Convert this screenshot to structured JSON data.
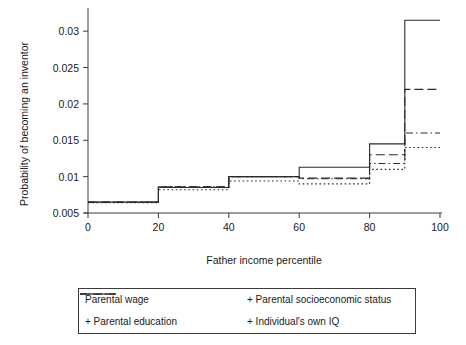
{
  "chart_data": {
    "type": "line",
    "title": "",
    "xlabel": "Father income percentile",
    "ylabel": "Probability of becoming an inventor",
    "xlim": [
      0,
      100
    ],
    "ylim": [
      0.005,
      0.0325
    ],
    "xticks": [
      0,
      20,
      40,
      60,
      80,
      100
    ],
    "xtick_labels": [
      "0",
      "20",
      "40",
      "60",
      "80",
      "100"
    ],
    "yticks": [
      0.005,
      0.01,
      0.015,
      0.02,
      0.025,
      0.03
    ],
    "ytick_labels": [
      "0.005",
      "0.01",
      "0.015",
      "0.02",
      "0.025",
      "0.03"
    ],
    "grid": false,
    "legend_position": "below",
    "step_edges": [
      0,
      20,
      40,
      60,
      80,
      90,
      100
    ],
    "series": [
      {
        "name": "Parental wage",
        "style": "solid",
        "values": [
          0.0065,
          0.0085,
          0.01,
          0.0113,
          0.0145,
          0.0315
        ]
      },
      {
        "name": "+ Parental socioeconomic status",
        "style": "long-dash",
        "values": [
          0.0065,
          0.0086,
          0.01,
          0.0098,
          0.013,
          0.022
        ]
      },
      {
        "name": "+ Parental education",
        "style": "dash-dot",
        "values": [
          0.0065,
          0.0086,
          0.01,
          0.0097,
          0.0118,
          0.016
        ]
      },
      {
        "name": "+ Individual's own IQ",
        "style": "dotted",
        "values": [
          0.0064,
          0.0082,
          0.0094,
          0.009,
          0.011,
          0.014
        ]
      }
    ]
  },
  "legend": {
    "entries": [
      {
        "label": "Parental wage",
        "icon": "solid-line-swatch"
      },
      {
        "label": "+ Parental socioeconomic status",
        "icon": "long-dash-line-swatch"
      },
      {
        "label": "+ Parental education",
        "icon": "dash-dot-line-swatch"
      },
      {
        "label": "+ Individual's own IQ",
        "icon": "dotted-line-swatch"
      }
    ]
  }
}
